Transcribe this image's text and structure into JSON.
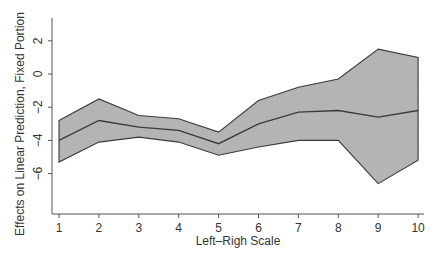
{
  "chart_data": {
    "type": "area",
    "title": "",
    "xlabel": "Left–Righ Scale",
    "ylabel": "Effects on Linear Prediction, Fixed Portion",
    "x": [
      1,
      2,
      3,
      4,
      5,
      6,
      7,
      8,
      9,
      10
    ],
    "xticks": [
      "1",
      "2",
      "3",
      "4",
      "5",
      "6",
      "7",
      "8",
      "9",
      "10"
    ],
    "yticks": [
      "2",
      "0",
      "−2",
      "−4",
      "−6"
    ],
    "ytick_values": [
      2,
      0,
      -2,
      -4,
      -6
    ],
    "xlim": [
      0.85,
      10.15
    ],
    "ylim": [
      -8.3,
      3.4
    ],
    "grid": false,
    "legend": null,
    "series": [
      {
        "name": "Upper bound",
        "values": [
          -2.8,
          -1.5,
          -2.5,
          -2.7,
          -3.5,
          -1.6,
          -0.8,
          -0.3,
          1.5,
          1.0
        ]
      },
      {
        "name": "Estimate",
        "values": [
          -4.0,
          -2.8,
          -3.2,
          -3.4,
          -4.2,
          -3.0,
          -2.3,
          -2.2,
          -2.6,
          -2.2
        ]
      },
      {
        "name": "Lower bound",
        "values": [
          -5.3,
          -4.1,
          -3.8,
          -4.1,
          -4.9,
          -4.4,
          -4.0,
          -4.0,
          -6.6,
          -5.2
        ]
      }
    ],
    "colors": {
      "band_fill": "#b4b4b4",
      "line": "#3a3a3a",
      "axis": "#555555"
    }
  }
}
